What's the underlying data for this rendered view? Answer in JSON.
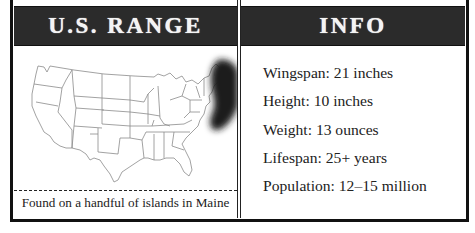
{
  "range_panel": {
    "title": "U.S. RANGE",
    "map": {
      "subject": "map-of-contiguous-united-states",
      "highlight_region": "Maine coast (northeast)",
      "highlight_color": "#1a1a1a",
      "outline_color": "#8a8a8a"
    },
    "caption": "Found on a handful of islands in Maine"
  },
  "info_panel": {
    "title": "INFO",
    "facts": [
      "Wingspan: 21 inches",
      "Height: 10 inches",
      "Weight: 13 ounces",
      "Lifespan: 25+ years",
      "Population: 12–15 million"
    ]
  },
  "colors": {
    "header_bg": "#2b2b2b",
    "header_text": "#f4f4f4",
    "border": "#111111",
    "text": "#222222"
  }
}
